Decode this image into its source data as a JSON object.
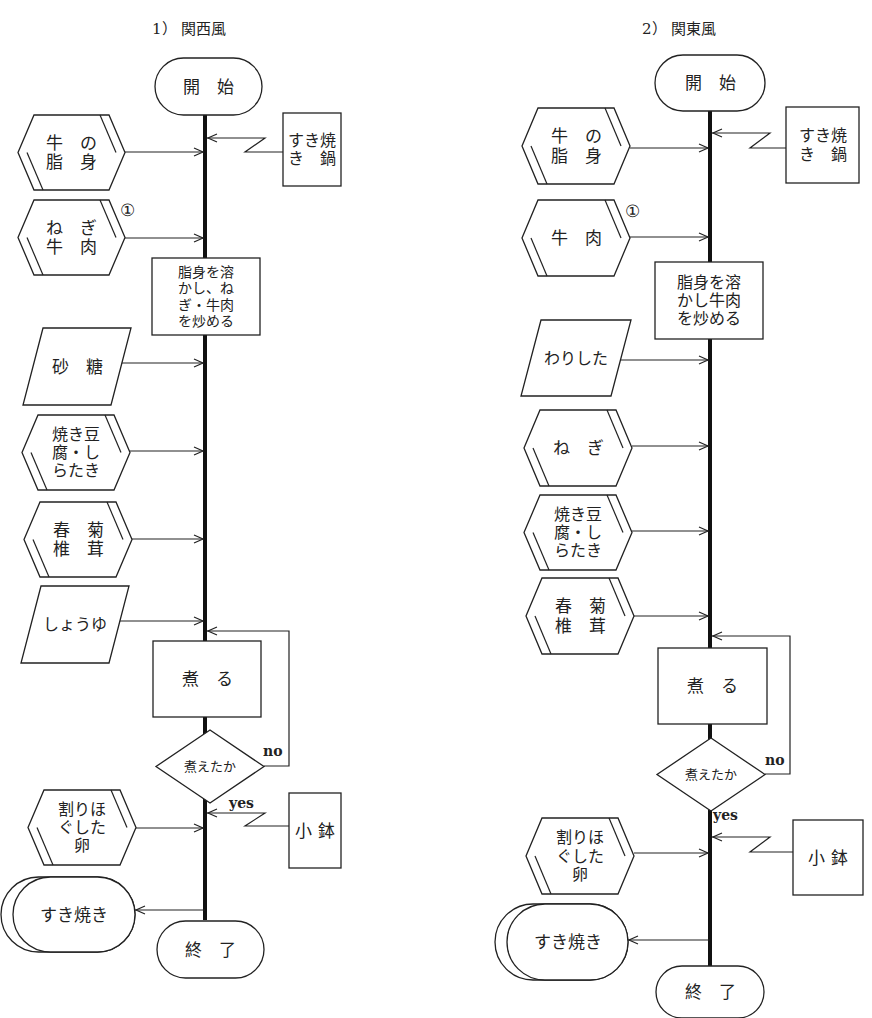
{
  "style": {
    "line_color": "#222222",
    "background": "#ffffff"
  },
  "charts": [
    {
      "id": "kansai",
      "title": "1） 関西風",
      "title_pos": [
        152,
        30
      ],
      "spine_x": 205,
      "spine": [
        115,
        920
      ],
      "nodes": [
        {
          "name": "start-terminal",
          "shape": "terminal",
          "x": 155,
          "y": 58,
          "w": 107,
          "h": 57,
          "lines": [
            "開　始"
          ],
          "fs": 17
        },
        {
          "name": "input-beef-fat",
          "shape": "hexagon",
          "x": 18,
          "y": 115,
          "w": 107,
          "h": 75,
          "lines": [
            "牛　の",
            "脂　身"
          ],
          "fs": 17,
          "arrow_y": 152
        },
        {
          "name": "input-sukiyaki-pan",
          "shape": "box",
          "x": 283,
          "y": 113,
          "w": 58,
          "h": 73,
          "lines": [
            "すき焼",
            "き　鍋"
          ],
          "fs": 16,
          "lightning": {
            "from_x": 283,
            "y": 152,
            "to_y": 138
          }
        },
        {
          "name": "input-negi-beef",
          "shape": "hexagon",
          "x": 18,
          "y": 200,
          "w": 107,
          "h": 75,
          "lines": [
            "ね　ぎ",
            "牛　肉"
          ],
          "fs": 17,
          "arrow_y": 238,
          "marker": "①",
          "marker_pos": [
            120,
            210
          ]
        },
        {
          "name": "process-melt-fry",
          "shape": "box",
          "x": 152,
          "y": 258,
          "w": 108,
          "h": 77,
          "lines": [
            "脂身を溶",
            "かし、ね",
            "ぎ・牛肉",
            "を炒める"
          ],
          "fs": 14
        },
        {
          "name": "input-sugar",
          "shape": "parallelogram",
          "x": 23,
          "y": 328,
          "w": 108,
          "h": 77,
          "lines": [
            "砂　糖"
          ],
          "fs": 17,
          "arrow_y": 363
        },
        {
          "name": "input-tofu-shirataki",
          "shape": "hexagon",
          "x": 22,
          "y": 415,
          "w": 108,
          "h": 75,
          "lines": [
            "焼き豆",
            "腐・し",
            "らたき"
          ],
          "fs": 16,
          "arrow_y": 451
        },
        {
          "name": "input-shungiku-shiitake",
          "shape": "hexagon",
          "x": 24,
          "y": 502,
          "w": 108,
          "h": 75,
          "lines": [
            "春　菊",
            "椎　茸"
          ],
          "fs": 17,
          "arrow_y": 539
        },
        {
          "name": "input-soy-sauce",
          "shape": "parallelogram",
          "x": 21,
          "y": 586,
          "w": 108,
          "h": 77,
          "lines": [
            "しょうゆ"
          ],
          "fs": 16,
          "arrow_y": 621
        },
        {
          "name": "process-simmer",
          "shape": "box",
          "x": 153,
          "y": 641,
          "w": 108,
          "h": 76,
          "lines": [
            "煮　る"
          ],
          "fs": 17
        },
        {
          "name": "decision-cooked",
          "shape": "diamond",
          "x": 156,
          "y": 730,
          "w": 108,
          "h": 73,
          "lines": [
            "煮えたか"
          ],
          "fs": 13
        },
        {
          "name": "input-beaten-egg",
          "shape": "hexagon",
          "x": 28,
          "y": 790,
          "w": 108,
          "h": 75,
          "lines": [
            "割りほ",
            "ぐした",
            "卵"
          ],
          "fs": 16,
          "arrow_y": 828
        },
        {
          "name": "input-small-bowl",
          "shape": "box",
          "x": 289,
          "y": 793,
          "w": 52,
          "h": 75,
          "lines": [
            "小 鉢"
          ],
          "fs": 17,
          "lightning": {
            "from_x": 289,
            "y": 826,
            "to_y": 813
          }
        },
        {
          "name": "output-sukiyaki",
          "shape": "stored",
          "x": 1,
          "y": 877,
          "w": 134,
          "h": 75,
          "lines": [
            "すき焼き"
          ],
          "fs": 17,
          "out_arrow_y": 910
        },
        {
          "name": "end-terminal",
          "shape": "terminal",
          "x": 157,
          "y": 921,
          "w": 107,
          "h": 57,
          "lines": [
            "終　了"
          ],
          "fs": 17
        }
      ],
      "loop": {
        "from_x": 264,
        "from_y": 766,
        "right_x": 289,
        "top_y": 631,
        "label_no": "no",
        "label_no_pos": [
          263,
          756
        ],
        "label_yes": "yes",
        "label_yes_pos": [
          229,
          808
        ]
      }
    },
    {
      "id": "kanto",
      "title": "2） 関東風",
      "title_pos": [
        642,
        30
      ],
      "spine_x": 710,
      "spine": [
        111,
        968
      ],
      "nodes": [
        {
          "name": "start-terminal",
          "shape": "terminal",
          "x": 655,
          "y": 55,
          "w": 110,
          "h": 56,
          "lines": [
            "開　始"
          ],
          "fs": 17
        },
        {
          "name": "input-beef-fat",
          "shape": "hexagon",
          "x": 522,
          "y": 108,
          "w": 108,
          "h": 76,
          "lines": [
            "牛　の",
            "脂　身"
          ],
          "fs": 17,
          "arrow_y": 148
        },
        {
          "name": "input-sukiyaki-pan",
          "shape": "box",
          "x": 786,
          "y": 107,
          "w": 73,
          "h": 76,
          "lines": [
            "すき焼",
            "き　鍋"
          ],
          "fs": 16,
          "lightning": {
            "from_x": 786,
            "y": 148,
            "to_y": 133
          }
        },
        {
          "name": "input-beef",
          "shape": "hexagon",
          "x": 522,
          "y": 200,
          "w": 108,
          "h": 76,
          "lines": [
            "牛　肉"
          ],
          "fs": 17,
          "arrow_y": 237,
          "marker": "①",
          "marker_pos": [
            625,
            211
          ]
        },
        {
          "name": "process-melt-fry",
          "shape": "box",
          "x": 655,
          "y": 262,
          "w": 108,
          "h": 77,
          "lines": [
            "脂身を溶",
            "かし牛肉",
            "を炒める"
          ],
          "fs": 16
        },
        {
          "name": "input-warishita",
          "shape": "parallelogram",
          "x": 521,
          "y": 320,
          "w": 110,
          "h": 76,
          "lines": [
            "わりした"
          ],
          "fs": 16,
          "arrow_y": 360
        },
        {
          "name": "input-negi",
          "shape": "hexagon",
          "x": 524,
          "y": 410,
          "w": 108,
          "h": 76,
          "lines": [
            "ね　ぎ"
          ],
          "fs": 17,
          "arrow_y": 446
        },
        {
          "name": "input-tofu-shirataki",
          "shape": "hexagon",
          "x": 524,
          "y": 495,
          "w": 108,
          "h": 75,
          "lines": [
            "焼き豆",
            "腐・し",
            "らたき"
          ],
          "fs": 16,
          "arrow_y": 531
        },
        {
          "name": "input-shungiku-shiitake",
          "shape": "hexagon",
          "x": 526,
          "y": 578,
          "w": 108,
          "h": 76,
          "lines": [
            "春　菊",
            "椎　茸"
          ],
          "fs": 17,
          "arrow_y": 616
        },
        {
          "name": "process-simmer",
          "shape": "box",
          "x": 658,
          "y": 648,
          "w": 109,
          "h": 76,
          "lines": [
            "煮　る"
          ],
          "fs": 17
        },
        {
          "name": "decision-cooked",
          "shape": "diamond",
          "x": 657,
          "y": 738,
          "w": 108,
          "h": 73,
          "lines": [
            "煮えたか"
          ],
          "fs": 13
        },
        {
          "name": "input-beaten-egg",
          "shape": "hexagon",
          "x": 526,
          "y": 818,
          "w": 108,
          "h": 76,
          "lines": [
            "割りほ",
            "ぐした",
            "卵"
          ],
          "fs": 16,
          "arrow_y": 853
        },
        {
          "name": "input-small-bowl",
          "shape": "box",
          "x": 793,
          "y": 820,
          "w": 70,
          "h": 75,
          "lines": [
            "小 鉢"
          ],
          "fs": 17,
          "lightning": {
            "from_x": 793,
            "y": 852,
            "to_y": 837
          }
        },
        {
          "name": "output-sukiyaki",
          "shape": "stored",
          "x": 495,
          "y": 904,
          "w": 133,
          "h": 76,
          "lines": [
            "すき焼き"
          ],
          "fs": 17,
          "out_arrow_y": 940
        },
        {
          "name": "end-terminal",
          "shape": "terminal",
          "x": 656,
          "y": 966,
          "w": 108,
          "h": 52,
          "lines": [
            "終　了"
          ],
          "fs": 17
        }
      ],
      "loop": {
        "from_x": 765,
        "from_y": 774,
        "right_x": 790,
        "top_y": 636,
        "label_no": "no",
        "label_no_pos": [
          765,
          765
        ],
        "label_yes": "yes",
        "label_yes_pos": [
          713,
          820
        ]
      }
    }
  ]
}
